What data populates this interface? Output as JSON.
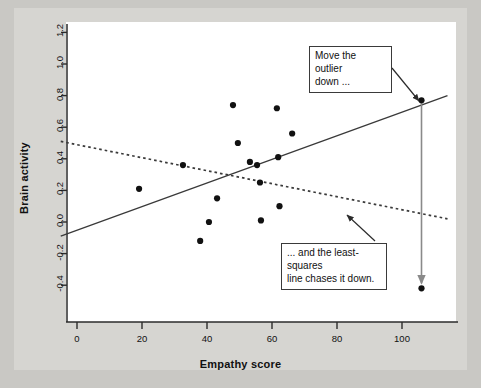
{
  "figure": {
    "background": "#c9c8c4",
    "plate_color": "#d6d5d1",
    "panel_color": "#ffffff"
  },
  "annotations": [
    {
      "name": "move-outlier-note",
      "text": "Move the outlier\ndown ...",
      "arrow_from": [
        392,
        68
      ],
      "arrow_to": [
        419,
        101
      ]
    },
    {
      "name": "least-squares-note",
      "text": "... and the least-squares\nline chases it down.",
      "arrow_from": [
        375,
        241
      ],
      "arrow_to": [
        347,
        215
      ]
    }
  ],
  "chart_data": {
    "type": "scatter",
    "title": "",
    "xlabel": "Empathy score",
    "ylabel": "Brain activity",
    "xlim": [
      -5,
      114
    ],
    "ylim": [
      -0.52,
      1.3
    ],
    "xticks": [
      0,
      20,
      40,
      60,
      80,
      100
    ],
    "yticks": [
      -0.4,
      -0.2,
      0.0,
      0.2,
      0.4,
      0.6,
      0.8,
      1.0,
      1.2
    ],
    "xtick_labels": [
      "0",
      "20",
      "40",
      "60",
      "80",
      "100"
    ],
    "ytick_labels": [
      "-0.4",
      "-0.2",
      "0.0",
      "0.2",
      "0.4",
      "0.6",
      "0.8",
      "1.0",
      "1.2"
    ],
    "grid": false,
    "legend": false,
    "point_color": "#111111",
    "point_size": 3.1,
    "points": [
      {
        "x": 19.1,
        "y": 0.21
      },
      {
        "x": 32.6,
        "y": 0.36
      },
      {
        "x": 37.9,
        "y": -0.12
      },
      {
        "x": 40.6,
        "y": 0.0
      },
      {
        "x": 43.1,
        "y": 0.15
      },
      {
        "x": 48.0,
        "y": 0.74
      },
      {
        "x": 49.5,
        "y": 0.5
      },
      {
        "x": 53.2,
        "y": 0.38
      },
      {
        "x": 55.4,
        "y": 0.36
      },
      {
        "x": 56.3,
        "y": 0.25
      },
      {
        "x": 56.6,
        "y": 0.01
      },
      {
        "x": 61.9,
        "y": 0.41
      },
      {
        "x": 61.5,
        "y": 0.72
      },
      {
        "x": 62.3,
        "y": 0.1
      },
      {
        "x": 66.2,
        "y": 0.56
      }
    ],
    "outlier": {
      "label": "outlier",
      "original": {
        "x": 106.0,
        "y": 0.77
      },
      "moved": {
        "x": 106.0,
        "y": -0.42
      }
    },
    "series": [
      {
        "name": "least-squares line (original)",
        "style": "solid",
        "color": "#3a3a3a",
        "x": [
          -5,
          114
        ],
        "y": [
          -0.09,
          0.8
        ]
      },
      {
        "name": "least-squares line (after moving outlier)",
        "style": "dotted",
        "color": "#3a3a3a",
        "x": [
          -5,
          114
        ],
        "y": [
          0.51,
          0.02
        ]
      }
    ],
    "arrow": {
      "name": "outlier-drag-arrow",
      "from": {
        "x": 106.0,
        "y": 0.77
      },
      "to": {
        "x": 106.0,
        "y": -0.42
      },
      "color": "#8a8a8a"
    }
  }
}
